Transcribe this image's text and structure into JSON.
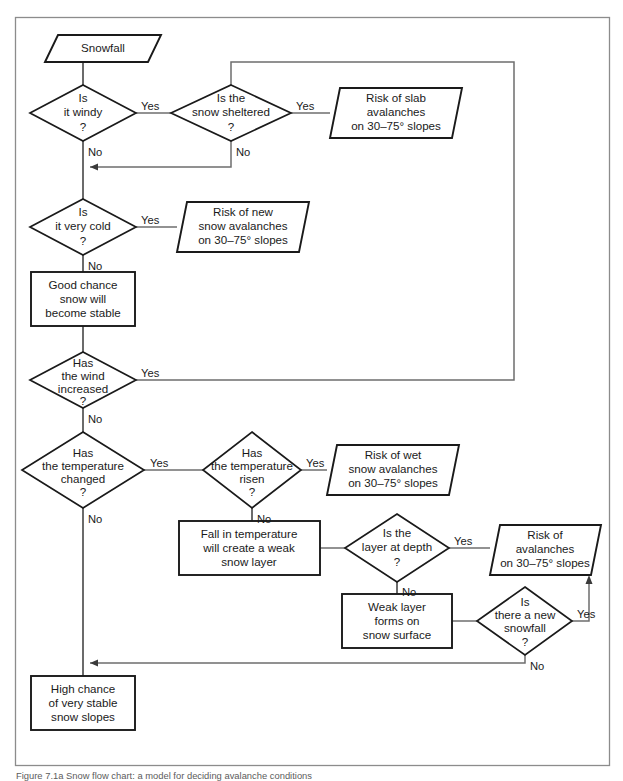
{
  "figure": {
    "caption": "Figure 7.1a Snow flow chart: a model for deciding avalanche conditions"
  },
  "colors": {
    "shape_stroke": "#1a1a1a",
    "connector": "#6e6e6e",
    "frame": "#8c8c8c",
    "background": "#ffffff",
    "text": "#1a1a1a"
  },
  "diagram": {
    "type": "flowchart",
    "nodes": [
      {
        "id": "snowfall",
        "shape": "parallelogram",
        "lines": [
          "Snowfall"
        ]
      },
      {
        "id": "is-it-windy",
        "shape": "diamond",
        "lines": [
          "Is",
          "it windy",
          "?"
        ]
      },
      {
        "id": "is-snow-sheltered",
        "shape": "diamond",
        "lines": [
          "Is the",
          "snow sheltered",
          "?"
        ]
      },
      {
        "id": "risk-slab-avalanches",
        "shape": "parallelogram",
        "lines": [
          "Risk of slab",
          "avalanches",
          "on 30–75° slopes"
        ]
      },
      {
        "id": "is-it-very-cold",
        "shape": "diamond",
        "lines": [
          "Is",
          "it very cold",
          "?"
        ]
      },
      {
        "id": "risk-new-snow-avalanches",
        "shape": "parallelogram",
        "lines": [
          "Risk of new",
          "snow avalanches",
          "on 30–75° slopes"
        ]
      },
      {
        "id": "good-chance-stable",
        "shape": "rectangle",
        "lines": [
          "Good chance",
          "snow will",
          "become stable"
        ]
      },
      {
        "id": "has-wind-increased",
        "shape": "diamond",
        "lines": [
          "Has",
          "the wind",
          "increased",
          "?"
        ]
      },
      {
        "id": "has-temperature-changed",
        "shape": "diamond",
        "lines": [
          "Has",
          "the temperature",
          "changed",
          "?"
        ]
      },
      {
        "id": "has-temperature-risen",
        "shape": "diamond",
        "lines": [
          "Has",
          "the temperature",
          "risen",
          "?"
        ]
      },
      {
        "id": "risk-wet-snow-avalanches",
        "shape": "parallelogram",
        "lines": [
          "Risk of wet",
          "snow avalanches",
          "on 30–75° slopes"
        ]
      },
      {
        "id": "fall-in-temperature",
        "shape": "rectangle",
        "lines": [
          "Fall in temperature",
          "will create a weak",
          "snow layer"
        ]
      },
      {
        "id": "is-layer-at-depth",
        "shape": "diamond",
        "lines": [
          "Is the",
          "layer at depth",
          "?"
        ]
      },
      {
        "id": "risk-avalanches",
        "shape": "parallelogram",
        "lines": [
          "Risk of",
          "avalanches",
          "on 30–75° slopes"
        ]
      },
      {
        "id": "weak-layer-forms",
        "shape": "rectangle",
        "lines": [
          "Weak layer",
          "forms on",
          "snow surface"
        ]
      },
      {
        "id": "is-there-new-snowfall",
        "shape": "diamond",
        "lines": [
          "Is",
          "there a new",
          "snowfall",
          "?"
        ]
      },
      {
        "id": "high-chance-stable",
        "shape": "rectangle",
        "lines": [
          "High chance",
          "of very stable",
          "snow slopes"
        ]
      }
    ],
    "edge_labels": {
      "windy_yes": "Yes",
      "windy_no": "No",
      "sheltered_yes": "Yes",
      "sheltered_no": "No",
      "cold_yes": "Yes",
      "cold_no": "No",
      "wind_increased_yes": "Yes",
      "wind_increased_no": "No",
      "temp_changed_yes": "Yes",
      "temp_changed_no": "No",
      "temp_risen_yes": "Yes",
      "temp_risen_no": "No",
      "layer_depth_yes": "Yes",
      "layer_depth_no": "No",
      "new_snowfall_yes": "Yes",
      "new_snowfall_no": "No"
    }
  }
}
